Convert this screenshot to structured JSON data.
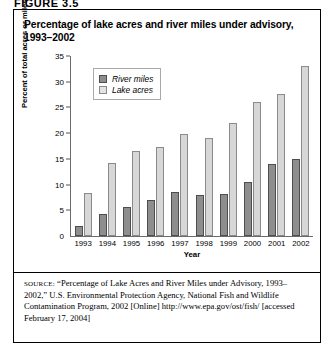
{
  "figure_label": "FIGURE 3.5",
  "title": {
    "line1": "Percentage of lake acres and river miles under advisory,",
    "line2": "1993–2002"
  },
  "legend": {
    "items": [
      {
        "label": "River miles",
        "color": "#8e8e8e"
      },
      {
        "label": "Lake acres",
        "color": "#d7d7d7"
      }
    ]
  },
  "axes": {
    "ylabel": "Percent of total acres or miles",
    "xlabel": "Year",
    "yticks": [
      "0",
      "5",
      "10",
      "15",
      "20",
      "25",
      "30",
      "35"
    ]
  },
  "source": {
    "keyword": "SOURCE:",
    "text": " “Percentage of Lake Acres and River Miles under Advisory, 1993–2002,” U.S. Environmental Protection Agency, National Fish and Wildlife Contamination Program, 2002 [Online] http://www.epa.gov/ost/fish/ [accessed February 17, 2004]"
  },
  "chart_data": {
    "type": "bar",
    "title": "Percentage of lake acres and river miles under advisory, 1993–2002",
    "xlabel": "Year",
    "ylabel": "Percent of total acres or miles",
    "ylim": [
      0,
      35
    ],
    "ytick_step": 5,
    "grid": false,
    "legend_position": "top-left-inside",
    "categories": [
      "1993",
      "1994",
      "1995",
      "1996",
      "1997",
      "1998",
      "1999",
      "2000",
      "2001",
      "2002"
    ],
    "series": [
      {
        "name": "River miles",
        "color": "#8e8e8e",
        "values": [
          2.0,
          4.3,
          5.6,
          7.1,
          8.5,
          8.0,
          8.1,
          10.5,
          14.0,
          15.0
        ]
      },
      {
        "name": "Lake acres",
        "color": "#d7d7d7",
        "values": [
          8.4,
          14.2,
          16.5,
          17.4,
          19.8,
          19.0,
          22.0,
          26.0,
          27.6,
          33.0
        ]
      }
    ]
  }
}
